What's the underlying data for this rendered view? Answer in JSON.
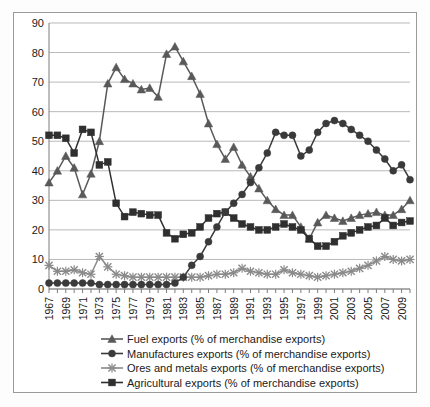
{
  "chart_data": {
    "type": "line",
    "title": "",
    "subtitle": "",
    "xlabel": "",
    "ylabel": "",
    "ylim": [
      0,
      90
    ],
    "ytick_step": 10,
    "yticks": [
      0,
      10,
      20,
      30,
      40,
      50,
      60,
      70,
      80,
      90
    ],
    "grid": true,
    "legend_position": "bottom",
    "xlim": [
      1967,
      2010
    ],
    "x": [
      1967,
      1968,
      1969,
      1970,
      1971,
      1972,
      1973,
      1974,
      1975,
      1976,
      1977,
      1978,
      1979,
      1980,
      1981,
      1982,
      1983,
      1984,
      1985,
      1986,
      1987,
      1988,
      1989,
      1990,
      1991,
      1992,
      1993,
      1994,
      1995,
      1996,
      1997,
      1998,
      1999,
      2000,
      2001,
      2002,
      2003,
      2004,
      2005,
      2006,
      2007,
      2008,
      2009,
      2010
    ],
    "xtick_labels": [
      "1967",
      "1969",
      "1971",
      "1973",
      "1975",
      "1977",
      "1979",
      "1981",
      "1983",
      "1985",
      "1987",
      "1989",
      "1991",
      "1993",
      "1995",
      "1997",
      "1999",
      "2001",
      "2003",
      "2005",
      "2007",
      "2009"
    ],
    "xtick_values": [
      1967,
      1969,
      1971,
      1973,
      1975,
      1977,
      1979,
      1981,
      1983,
      1985,
      1987,
      1989,
      1991,
      1993,
      1995,
      1997,
      1999,
      2001,
      2003,
      2005,
      2007,
      2009
    ],
    "series": [
      {
        "name": "Fuel exports (% of merchandise exports)",
        "marker": "triangle",
        "color": "#595959",
        "values": [
          36,
          40,
          45,
          41,
          32,
          39,
          50,
          69.5,
          75,
          71,
          69.5,
          67.5,
          68,
          65,
          79.5,
          82,
          77,
          72,
          66,
          56,
          49,
          44,
          48,
          42,
          38,
          34,
          30,
          27,
          25,
          25,
          21,
          17,
          22.5,
          25,
          24,
          23,
          24,
          25,
          25.5,
          26,
          25,
          25,
          27,
          30
        ]
      },
      {
        "name": "Manufactures exports (% of merchandise exports)",
        "marker": "circle",
        "color": "#3a3a3a",
        "values": [
          2,
          2,
          2,
          2,
          2,
          2,
          1.5,
          1.5,
          1.5,
          1.5,
          1.5,
          1.5,
          1.5,
          1.5,
          1.5,
          2,
          4,
          8,
          11,
          16,
          21,
          26,
          29,
          32,
          36,
          41,
          46,
          53,
          52,
          52,
          45,
          47,
          53,
          56,
          57,
          56,
          54,
          52,
          50,
          47,
          44,
          40,
          42,
          37
        ]
      },
      {
        "name": "Ores and metals exports (% of merchandise exports)",
        "marker": "x",
        "color": "#8a8a8a",
        "values": [
          8,
          6,
          6,
          6.5,
          5.5,
          5,
          11,
          7.5,
          5,
          4.5,
          4,
          4,
          4,
          4,
          4,
          4,
          4,
          4,
          4,
          4.5,
          5,
          5,
          5.5,
          7,
          6,
          5.5,
          5,
          5,
          6.5,
          5.5,
          5,
          4.5,
          4,
          4.5,
          5,
          5.5,
          6,
          7,
          8,
          9.5,
          11,
          10,
          9.5,
          10
        ]
      },
      {
        "name": "Agricultural exports (% of merchandise exports)",
        "marker": "square",
        "color": "#2f2f2f",
        "values": [
          52,
          52,
          51,
          46,
          54,
          53,
          42,
          43,
          29,
          24.5,
          26,
          25.5,
          25,
          25,
          19,
          17,
          18.5,
          19,
          21,
          24,
          25.5,
          26,
          24,
          22,
          21,
          20,
          20,
          21,
          22,
          21,
          20,
          17,
          14.5,
          14.5,
          16,
          18,
          19,
          20,
          21,
          21.5,
          24,
          21.5,
          22.5,
          23
        ]
      }
    ]
  },
  "legend": {
    "items": [
      {
        "label": "Fuel exports (% of merchandise exports)",
        "marker": "triangle"
      },
      {
        "label": "Manufactures exports (% of merchandise exports)",
        "marker": "circle"
      },
      {
        "label": "Ores and metals exports (% of merchandise exports)",
        "marker": "x"
      },
      {
        "label": "Agricultural exports (% of merchandise exports)",
        "marker": "square"
      }
    ]
  }
}
